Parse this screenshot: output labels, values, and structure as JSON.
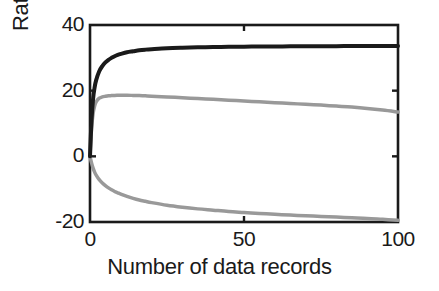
{
  "chart_data": {
    "type": "line",
    "title": "",
    "xlabel": "Number of data records",
    "ylabel": "Ratio (dB)",
    "xlim": [
      0,
      100
    ],
    "ylim": [
      -20,
      40
    ],
    "xticks": [
      0,
      50,
      100
    ],
    "yticks": [
      -20,
      0,
      20,
      40
    ],
    "xtick_labels": [
      "0",
      "50",
      "100"
    ],
    "ytick_labels": [
      "-20",
      "0",
      "20",
      "40"
    ],
    "grid": false,
    "legend": "none",
    "box": true,
    "colors": {
      "black_curve": "#1a1a1a",
      "gray_curve": "#999999",
      "axis": "#1a1a1a",
      "background": "#ffffff"
    },
    "x": [
      0,
      0.5,
      1,
      1.5,
      2,
      3,
      4,
      5,
      6,
      7,
      8,
      9,
      10,
      12,
      14,
      16,
      18,
      20,
      25,
      30,
      35,
      40,
      45,
      50,
      55,
      60,
      65,
      70,
      75,
      80,
      85,
      90,
      95,
      100
    ],
    "series": [
      {
        "name": "upper-black-curve",
        "color": "#1a1a1a",
        "width": 4,
        "values": [
          0,
          11.0,
          17.5,
          21.0,
          23.2,
          25.9,
          27.5,
          28.6,
          29.4,
          30.0,
          30.5,
          30.9,
          31.2,
          31.7,
          32.0,
          32.3,
          32.5,
          32.65,
          32.95,
          33.1,
          33.2,
          33.28,
          33.34,
          33.4,
          33.44,
          33.47,
          33.5,
          33.52,
          33.54,
          33.56,
          33.58,
          33.6,
          33.61,
          33.62
        ]
      },
      {
        "name": "middle-gray-curve",
        "color": "#999999",
        "width": 3.5,
        "values": [
          0,
          8.5,
          13.0,
          15.3,
          16.6,
          17.7,
          18.1,
          18.3,
          18.45,
          18.5,
          18.55,
          18.58,
          18.6,
          18.6,
          18.55,
          18.5,
          18.42,
          18.33,
          18.1,
          17.85,
          17.6,
          17.35,
          17.1,
          16.85,
          16.6,
          16.35,
          16.1,
          15.85,
          15.6,
          15.3,
          15.0,
          14.6,
          14.1,
          13.5
        ]
      },
      {
        "name": "lower-gray-curve",
        "color": "#999999",
        "width": 3.5,
        "values": [
          0,
          -2.0,
          -3.6,
          -4.8,
          -5.7,
          -7.1,
          -8.1,
          -8.9,
          -9.6,
          -10.2,
          -10.7,
          -11.1,
          -11.5,
          -12.2,
          -12.8,
          -13.3,
          -13.7,
          -14.1,
          -14.9,
          -15.5,
          -16.0,
          -16.4,
          -16.8,
          -17.1,
          -17.4,
          -17.65,
          -17.9,
          -18.1,
          -18.3,
          -18.5,
          -18.7,
          -18.9,
          -19.2,
          -19.5
        ]
      }
    ]
  }
}
